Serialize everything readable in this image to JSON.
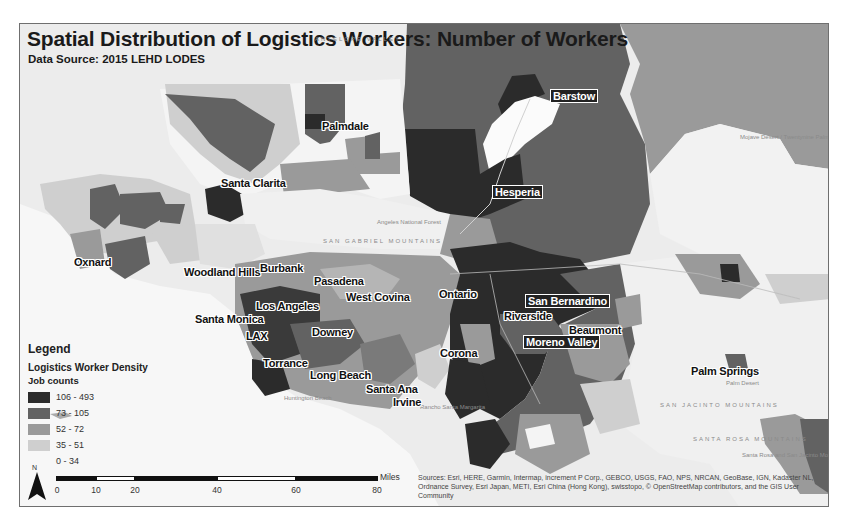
{
  "map": {
    "title": "Spatial Distribution of Logistics Workers: Number of Workers",
    "subtitle": "Data Source: 2015 LEHD LODES",
    "cities": [
      {
        "name": "Barstow",
        "x": 530,
        "y": 65,
        "boxed": true
      },
      {
        "name": "Palmdale",
        "x": 302,
        "y": 96,
        "boxed": false
      },
      {
        "name": "Santa Clarita",
        "x": 201,
        "y": 153,
        "boxed": false
      },
      {
        "name": "Hesperia",
        "x": 472,
        "y": 161,
        "boxed": true
      },
      {
        "name": "Oxnard",
        "x": 54,
        "y": 232,
        "boxed": false
      },
      {
        "name": "Woodland Hills",
        "x": 164,
        "y": 242,
        "boxed": false
      },
      {
        "name": "Burbank",
        "x": 240,
        "y": 238,
        "boxed": false
      },
      {
        "name": "Pasadena",
        "x": 294,
        "y": 251,
        "boxed": false
      },
      {
        "name": "West Covina",
        "x": 326,
        "y": 267,
        "boxed": false
      },
      {
        "name": "Ontario",
        "x": 419,
        "y": 264,
        "boxed": false
      },
      {
        "name": "San Bernardino",
        "x": 505,
        "y": 270,
        "boxed": true
      },
      {
        "name": "Los Angeles",
        "x": 236,
        "y": 276,
        "boxed": false
      },
      {
        "name": "Riverside",
        "x": 484,
        "y": 286,
        "boxed": false
      },
      {
        "name": "Santa Monica",
        "x": 175,
        "y": 289,
        "boxed": false
      },
      {
        "name": "Beaumont",
        "x": 549,
        "y": 300,
        "boxed": false
      },
      {
        "name": "LAX",
        "x": 226,
        "y": 306,
        "boxed": false
      },
      {
        "name": "Downey",
        "x": 292,
        "y": 302,
        "boxed": false
      },
      {
        "name": "Moreno Valley",
        "x": 503,
        "y": 311,
        "boxed": true
      },
      {
        "name": "Corona",
        "x": 420,
        "y": 323,
        "boxed": false
      },
      {
        "name": "Torrance",
        "x": 243,
        "y": 333,
        "boxed": false
      },
      {
        "name": "Long Beach",
        "x": 290,
        "y": 345,
        "boxed": false
      },
      {
        "name": "Palm Springs",
        "x": 671,
        "y": 341,
        "boxed": false
      },
      {
        "name": "Santa Ana",
        "x": 346,
        "y": 359,
        "boxed": false
      },
      {
        "name": "Irvine",
        "x": 373,
        "y": 372,
        "boxed": false
      }
    ],
    "physical_labels": [
      {
        "text": "ANTELOPE VALLEY",
        "x": 295,
        "y": 12
      },
      {
        "text": "SAN GABRIEL MOUNTAINS",
        "x": 303,
        "y": 214
      },
      {
        "text": "SAN JACINTO MOUNTAINS",
        "x": 640,
        "y": 378
      },
      {
        "text": "SANTA ROSA MOUNTAINS",
        "x": 673,
        "y": 412
      }
    ],
    "small_places": [
      {
        "text": "Mojave Desert / Twentynine Palms",
        "x": 720,
        "y": 110
      },
      {
        "text": "Angeles National Forest",
        "x": 357,
        "y": 195
      },
      {
        "text": "Huntington Beach",
        "x": 264,
        "y": 371
      },
      {
        "text": "Rancho Santa Margarita",
        "x": 400,
        "y": 380
      },
      {
        "text": "Palm Desert",
        "x": 706,
        "y": 356
      },
      {
        "text": "Santa Rosa and San Jacinto Mountains",
        "x": 722,
        "y": 428
      }
    ]
  },
  "legend": {
    "title": "Legend",
    "layer": "Logistics Worker Density",
    "field": "Job counts",
    "classes": [
      {
        "label": "106 - 493",
        "color": "#2b2b2b"
      },
      {
        "label": "73 - 105",
        "color": "#626262"
      },
      {
        "label": "52 - 72",
        "color": "#9a9a9a"
      },
      {
        "label": "35 - 51",
        "color": "#cfcfcf"
      },
      {
        "label": "0 - 34",
        "color": "#f4f4f4"
      }
    ]
  },
  "north_arrow": {
    "label": "N"
  },
  "scale_bar": {
    "unit": "Miles",
    "ticks": [
      "0",
      "10",
      "20",
      "40",
      "60",
      "80"
    ]
  },
  "attribution": "Sources: Esri, HERE, Garmin, Intermap, increment P Corp., GEBCO, USGS, FAO, NPS, NRCAN, GeoBase, IGN, Kadaster NL, Ordnance Survey, Esri Japan, METI, Esri China (Hong Kong), swisstopo, © OpenStreetMap contributors, and the GIS User Community"
}
